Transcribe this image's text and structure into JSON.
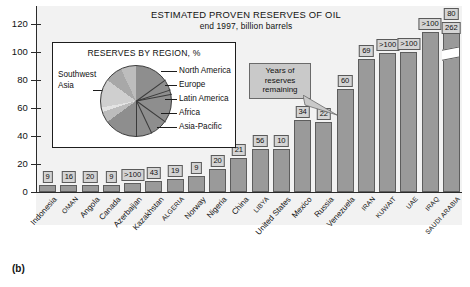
{
  "figure": {
    "letter": "(b)"
  },
  "chart_data": {
    "type": "bar",
    "title": "ESTIMATED PROVEN RESERVES OF OIL",
    "subtitle": "end 1997, billion barrels",
    "xlabel": "",
    "ylabel": "",
    "ylim": [
      0,
      130
    ],
    "yticks": [
      0,
      20,
      40,
      60,
      80,
      100,
      120
    ],
    "grid": false,
    "legend": "none",
    "annotation": "Years of reserves remaining",
    "note": "Bar heights are billion barrels of proven reserves; boxed number above each bar is years of reserves remaining.",
    "categories": [
      "Indonesia",
      "OMAN",
      "Angola",
      "Canada",
      "Azerbaijan",
      "Kazakhstan",
      "ALGERIA",
      "Norway",
      "Nigeria",
      "China",
      "LIBYA",
      "United States",
      "Mexico",
      "Russia",
      "Venezuela",
      "IRAN",
      "KUWAIT",
      "UAE",
      "IRAQ",
      "SAUDI ARABIA"
    ],
    "values": [
      5,
      5,
      5,
      5,
      6,
      8,
      9,
      11,
      16,
      24,
      30,
      30,
      50,
      49,
      72,
      93,
      97,
      98,
      112,
      262
    ],
    "value_labels": [
      "9",
      "16",
      "20",
      "9",
      ">100",
      "43",
      "19",
      "9",
      "20",
      "21",
      "56",
      "10",
      "34",
      "22",
      "60",
      "69",
      ">100",
      ">100",
      ">100",
      "262"
    ],
    "series": [
      {
        "name": "Years of reserves remaining",
        "values": [
          9,
          16,
          20,
          9,
          100,
          43,
          19,
          9,
          20,
          21,
          56,
          10,
          34,
          22,
          60,
          69,
          100,
          100,
          100,
          80
        ]
      }
    ],
    "saudi_break": {
      "reserves_label": "262",
      "years_label": "80",
      "axis_broken": true
    },
    "colors": {
      "bar_fill": "#9a9a9a",
      "bar_stroke": "#5d5d5d",
      "plot_background": "#f2f2f2",
      "value_box": "#d4d4d4",
      "callout": "#c9c9c9",
      "axis": "#2b2b2b"
    }
  },
  "inset_chart": {
    "type": "pie",
    "title": "RESERVES BY REGION, %",
    "categories": [
      "Southwest Asia",
      "North America",
      "Europe",
      "Latin America",
      "Africa",
      "Asia-Pacific"
    ],
    "values": [
      65,
      5,
      2,
      13,
      8,
      7
    ],
    "colors": [
      "#8e8e8e",
      "#bcbcbc",
      "#e3e3e3",
      "#cfcfcf",
      "#a8a8a8",
      "#bdbdbd"
    ],
    "legend_position": "right-leader-lines",
    "left_label": "Southwest\nAsia",
    "left_label_line1": "Southwest",
    "left_label_line2": "Asia",
    "right_labels": [
      "North America",
      "Europe",
      "Latin America",
      "Africa",
      "Asia-Pacific"
    ]
  },
  "axis": {
    "tick_0": "0",
    "tick_20": "20",
    "tick_40": "40",
    "tick_60": "60",
    "tick_80": "80",
    "tick_100": "100",
    "tick_120": "120"
  },
  "callout": {
    "line1": "Years of",
    "line2": "reserves",
    "line3": "remaining"
  }
}
